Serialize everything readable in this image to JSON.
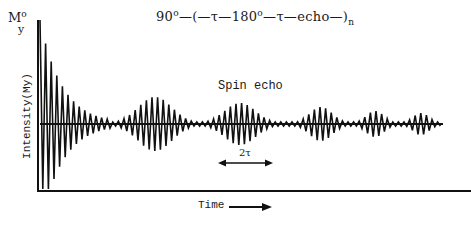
{
  "chart_data": {
    "type": "line",
    "title_parts": {
      "pulse1": "90",
      "deg": "o",
      "seq": "—(—τ—180",
      "deg2": "o",
      "rest": "—τ—echo—)",
      "sub": "n"
    },
    "ylabel": "Intensity(My)",
    "ylabel_top": {
      "main": "M",
      "sup": "o",
      "sub": "y"
    },
    "xlabel": "Time",
    "annotations": [
      {
        "text": "Spin echo",
        "x": 218,
        "y": 79
      },
      {
        "text": "2τ",
        "arrow_from_x": 218,
        "arrow_to_x": 273,
        "arrow_y": 163
      }
    ],
    "grid": false,
    "axes": {
      "origin_px": [
        38,
        191
      ],
      "y_top_px": 20,
      "x_right_px": 471,
      "baseline_px": 124
    },
    "fid": {
      "start_x": 40,
      "peak_amplitude": 104,
      "decay_px": 22,
      "cycles_per_px": 0.17,
      "end_x": 112
    },
    "echoes": [
      {
        "index": 1,
        "center_x": 155,
        "half_width": 36,
        "amplitude": 27
      },
      {
        "index": 2,
        "center_x": 240,
        "half_width": 33,
        "amplitude": 21
      },
      {
        "index": 3,
        "center_x": 321,
        "half_width": 24,
        "amplitude": 17
      },
      {
        "index": 4,
        "center_x": 375,
        "half_width": 19,
        "amplitude": 13
      },
      {
        "index": 5,
        "center_x": 421,
        "half_width": 17,
        "amplitude": 11
      }
    ],
    "noise_amplitude": 2,
    "oscillation_period_px": 5.6
  },
  "labels": {
    "title_main": "90",
    "title_deg": "o",
    "title_mid": "—(—τ—180",
    "title_deg2": "o",
    "title_end": "—τ—echo—)",
    "title_sub": "n",
    "ylabel_m": "M",
    "ylabel_sup": "o",
    "ylabel_sub": "y",
    "ylabel": "Intensity(My)",
    "echo_label": "Spin echo",
    "tau_label": "2τ",
    "xlabel": "Time"
  }
}
